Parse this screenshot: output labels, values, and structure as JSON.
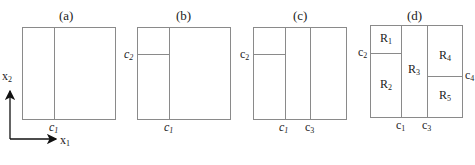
{
  "axes": {
    "x_label": "x",
    "x_sub": "1",
    "y_label": "x",
    "y_sub": "2"
  },
  "panels": [
    {
      "id": "a",
      "title": "(a)",
      "splits": [
        "c1"
      ]
    },
    {
      "id": "b",
      "title": "(b)",
      "splits": [
        "c1",
        "c2"
      ]
    },
    {
      "id": "c",
      "title": "(c)",
      "splits": [
        "c1",
        "c2",
        "c3"
      ]
    },
    {
      "id": "d",
      "title": "(d)",
      "splits": [
        "c1",
        "c2",
        "c3",
        "c4"
      ],
      "regions": [
        {
          "name": "R",
          "sub": "1"
        },
        {
          "name": "R",
          "sub": "2"
        },
        {
          "name": "R",
          "sub": "3"
        },
        {
          "name": "R",
          "sub": "4"
        },
        {
          "name": "R",
          "sub": "5"
        }
      ]
    }
  ],
  "labels": {
    "c": "c",
    "s1": "1",
    "s2": "2",
    "s3": "3",
    "s4": "4"
  },
  "colors": {
    "line": "#8a8a8a",
    "axis": "#111111"
  }
}
